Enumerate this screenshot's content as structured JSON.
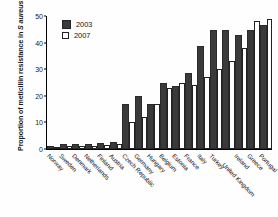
{
  "chart_data": {
    "type": "bar",
    "title": "",
    "xlabel": "",
    "ylabel": "Proportion of meticillin resistance in S aureus",
    "ylabel_plain": "Proportion of meticillin resistance in ",
    "ylabel_italic": "S aureus",
    "ylim": [
      0,
      50
    ],
    "yticks": [
      0,
      10,
      20,
      30,
      40,
      50
    ],
    "grid": false,
    "legend_position": "top-left",
    "categories": [
      "Norway",
      "Sweden",
      "Denmark",
      "Netherlands",
      "Finland",
      "Austria",
      "Czech Republic",
      "Germany",
      "Hungary",
      "Belgium",
      "Estonia",
      "France",
      "Italy",
      "Turkey",
      "United Kingdom",
      "Ireland",
      "Greece",
      "Portugal"
    ],
    "series": [
      {
        "name": "2003",
        "color": "#3a3a3a",
        "values": [
          0.5,
          1,
          1,
          1,
          1.5,
          2,
          16,
          19,
          16,
          24,
          23,
          28,
          38,
          44,
          44,
          42,
          44,
          46
        ]
      },
      {
        "name": "2007",
        "color": "#ffffff",
        "values": [
          0.5,
          1,
          1,
          1,
          1.5,
          2,
          10,
          12,
          17,
          23,
          25,
          24,
          27,
          30,
          33,
          38,
          48,
          49
        ]
      }
    ]
  },
  "legend": {
    "items": [
      {
        "label": "2003",
        "swatch": "filled-square-icon"
      },
      {
        "label": "2007",
        "swatch": "open-square-icon"
      }
    ]
  }
}
